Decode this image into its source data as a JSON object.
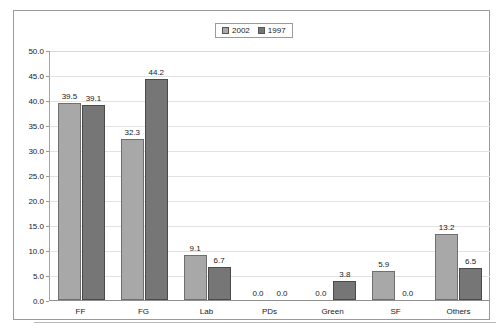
{
  "chart_data": {
    "type": "bar",
    "title": "",
    "xlabel": "",
    "ylabel": "",
    "ylim": [
      0,
      50
    ],
    "ytick_step": 5,
    "grid": true,
    "legend_position": "top-center",
    "categories": [
      "FF",
      "FG",
      "Lab",
      "PDs",
      "Green",
      "SF",
      "Others"
    ],
    "ytick_labels": [
      "0.0",
      "5.0",
      "10.0",
      "15.0",
      "20.0",
      "25.0",
      "30.0",
      "35.0",
      "40.0",
      "45.0",
      "50.0"
    ],
    "series": [
      {
        "name": "2002",
        "color": "#a8a8a8",
        "values": [
          39.5,
          32.3,
          9.1,
          0.0,
          0.0,
          5.9,
          13.2
        ],
        "labels": [
          "39.5",
          "32.3",
          "9.1",
          "0.0",
          "0.0",
          "5.9",
          "13.2"
        ]
      },
      {
        "name": "1997",
        "color": "#767676",
        "values": [
          39.1,
          44.2,
          6.7,
          0.0,
          3.8,
          0.0,
          6.5
        ],
        "labels": [
          "39.1",
          "44.2",
          "6.7",
          "0.0",
          "3.8",
          "0.0",
          "6.5"
        ]
      }
    ]
  },
  "legend": {
    "entries": [
      {
        "label": "2002",
        "color": "#a8a8a8"
      },
      {
        "label": "1997",
        "color": "#767676"
      }
    ]
  }
}
